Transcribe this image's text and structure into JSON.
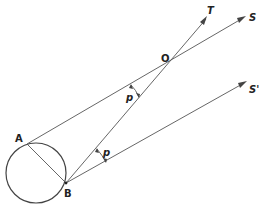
{
  "diagram": {
    "labels": {
      "A": "A",
      "B": "B",
      "O": "O",
      "T": "T",
      "S": "S",
      "S_prime": "S'",
      "p_upper": "p",
      "p_lower": "p"
    },
    "points": {
      "circle_center": [
        36,
        173
      ],
      "circle_radius": 30,
      "A": [
        27,
        144
      ],
      "B": [
        66,
        183
      ],
      "O": [
        170,
        65
      ],
      "T_tip": [
        207,
        17
      ],
      "S_tip": [
        245,
        17
      ],
      "S_prime_tip": [
        246,
        82
      ]
    },
    "colors": {
      "line": "#555555",
      "text": "#222222",
      "background": "#ffffff"
    }
  }
}
